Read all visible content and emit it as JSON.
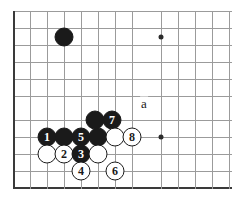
{
  "diagram": {
    "kind": "go-board-diagram",
    "board": {
      "width_px": 232,
      "height_px": 201,
      "line_color": "#9b9b9b",
      "edge_color": "#3a3a3a",
      "background": "#ffffff",
      "left_edge_x": 13,
      "bottom_edge_y": 188,
      "top_line_y": 11,
      "grid_spacing_px": 17,
      "columns_x": [
        13,
        30,
        47,
        64,
        81,
        98,
        115,
        132,
        144,
        161,
        178,
        195,
        212,
        229
      ],
      "rows_y": [
        11,
        28,
        45,
        62,
        79,
        96,
        103,
        120,
        137,
        154,
        171,
        188
      ]
    },
    "star_points": [
      {
        "name": "upper-right-hoshi",
        "x": 161,
        "y": 37
      },
      {
        "name": "lower-right-hoshi",
        "x": 161,
        "y": 137
      }
    ],
    "stones": [
      {
        "name": "black-stone-upper-left",
        "color": "black",
        "label": "",
        "x": 64,
        "y": 37
      },
      {
        "name": "black-stone-move-7",
        "color": "black",
        "label": "7",
        "x": 112,
        "y": 120
      },
      {
        "name": "black-stone-plain-upper",
        "color": "black",
        "label": "",
        "x": 95,
        "y": 120
      },
      {
        "name": "black-stone-move-1",
        "color": "black",
        "label": "1",
        "x": 47,
        "y": 137
      },
      {
        "name": "black-stone-plain-mid",
        "color": "black",
        "label": "",
        "x": 64,
        "y": 137
      },
      {
        "name": "black-stone-move-5",
        "color": "black",
        "label": "5",
        "x": 81,
        "y": 137
      },
      {
        "name": "black-stone-plain-right",
        "color": "black",
        "label": "",
        "x": 98,
        "y": 137
      },
      {
        "name": "white-stone-contact",
        "color": "white",
        "label": "",
        "x": 115,
        "y": 137
      },
      {
        "name": "white-stone-move-8",
        "color": "white",
        "label": "8",
        "x": 132,
        "y": 137
      },
      {
        "name": "white-stone-plain-left",
        "color": "white",
        "label": "",
        "x": 47,
        "y": 154
      },
      {
        "name": "white-stone-move-2",
        "color": "white",
        "label": "2",
        "x": 64,
        "y": 154
      },
      {
        "name": "black-stone-move-3",
        "color": "black",
        "label": "3",
        "x": 81,
        "y": 154
      },
      {
        "name": "white-stone-plain-right",
        "color": "white",
        "label": "",
        "x": 98,
        "y": 154
      },
      {
        "name": "white-stone-move-4",
        "color": "white",
        "label": "4",
        "x": 81,
        "y": 171
      },
      {
        "name": "white-stone-move-6",
        "color": "white",
        "label": "6",
        "x": 115,
        "y": 171
      }
    ],
    "point_labels": [
      {
        "name": "point-label-a",
        "text": "a",
        "x": 144,
        "y": 103
      }
    ]
  }
}
